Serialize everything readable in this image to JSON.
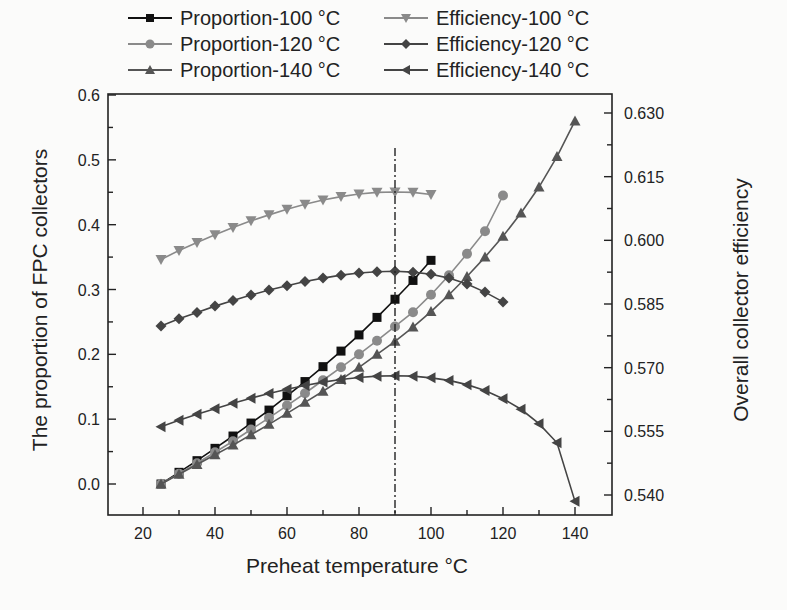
{
  "chart_data": {
    "type": "line",
    "title": "",
    "xlabel": "Preheat temperature °C",
    "ylabel": "The proportion of FPC collectors",
    "y2label": "Overall collector efficiency",
    "xlim": [
      10,
      150
    ],
    "ylim": [
      -0.05,
      0.6
    ],
    "y2lim": [
      0.5355,
      0.633
    ],
    "xticks": [
      20,
      40,
      60,
      80,
      100,
      120,
      140
    ],
    "yticks": [
      "0.0",
      "0.1",
      "0.2",
      "0.3",
      "0.4",
      "0.5",
      "0.6"
    ],
    "y2ticks": [
      "0.540",
      "0.555",
      "0.570",
      "0.585",
      "0.600",
      "0.615",
      "0.630"
    ],
    "grid": false,
    "legend_position": "top",
    "annotations": [
      {
        "type": "vertical-dash-dot-line",
        "x": 90
      }
    ],
    "series": [
      {
        "name": "Proportion-100 °C",
        "axis": "left",
        "marker": "square",
        "color": "#111111",
        "x": [
          25,
          30,
          35,
          40,
          45,
          50,
          55,
          60,
          65,
          70,
          75,
          80,
          85,
          90,
          95,
          100
        ],
        "values": [
          0.0,
          0.018,
          0.036,
          0.055,
          0.074,
          0.094,
          0.114,
          0.136,
          0.158,
          0.181,
          0.205,
          0.23,
          0.257,
          0.285,
          0.314,
          0.345
        ]
      },
      {
        "name": "Proportion-120 °C",
        "axis": "left",
        "marker": "circle",
        "color": "#8a8a8a",
        "x": [
          25,
          30,
          35,
          40,
          45,
          50,
          55,
          60,
          65,
          70,
          75,
          80,
          85,
          90,
          95,
          100,
          105,
          110,
          115,
          120
        ],
        "values": [
          0.0,
          0.016,
          0.032,
          0.049,
          0.066,
          0.084,
          0.102,
          0.121,
          0.14,
          0.16,
          0.18,
          0.2,
          0.221,
          0.243,
          0.265,
          0.292,
          0.322,
          0.355,
          0.39,
          0.445
        ]
      },
      {
        "name": "Proportion-140 °C",
        "axis": "left",
        "marker": "triangle-up",
        "color": "#555555",
        "x": [
          25,
          30,
          35,
          40,
          45,
          50,
          55,
          60,
          65,
          70,
          75,
          80,
          85,
          90,
          95,
          100,
          105,
          110,
          115,
          120,
          125,
          130,
          135,
          140
        ],
        "values": [
          0.0,
          0.015,
          0.03,
          0.045,
          0.06,
          0.076,
          0.092,
          0.109,
          0.126,
          0.143,
          0.161,
          0.18,
          0.2,
          0.22,
          0.242,
          0.266,
          0.292,
          0.32,
          0.35,
          0.382,
          0.418,
          0.458,
          0.505,
          0.56
        ]
      },
      {
        "name": "Efficiency-100 °C",
        "axis": "right",
        "marker": "triangle-down",
        "color": "#8a8a8a",
        "x": [
          25,
          30,
          35,
          40,
          45,
          50,
          55,
          60,
          65,
          70,
          75,
          80,
          85,
          90,
          95,
          100
        ],
        "values": [
          0.5955,
          0.5976,
          0.5995,
          0.6013,
          0.603,
          0.6046,
          0.606,
          0.6073,
          0.6085,
          0.6095,
          0.6103,
          0.6109,
          0.6113,
          0.6114,
          0.6113,
          0.6108
        ]
      },
      {
        "name": "Efficiency-120 °C",
        "axis": "right",
        "marker": "diamond",
        "color": "#444444",
        "x": [
          25,
          30,
          35,
          40,
          45,
          50,
          55,
          60,
          65,
          70,
          75,
          80,
          85,
          90,
          95,
          100,
          105,
          110,
          115,
          120
        ],
        "values": [
          0.5798,
          0.5815,
          0.583,
          0.5845,
          0.5858,
          0.5871,
          0.5883,
          0.5893,
          0.5903,
          0.5911,
          0.5918,
          0.5923,
          0.5926,
          0.5927,
          0.5925,
          0.592,
          0.5911,
          0.5897,
          0.5878,
          0.5855
        ]
      },
      {
        "name": "Efficiency-140 °C",
        "axis": "right",
        "marker": "triangle-left",
        "color": "#444444",
        "x": [
          25,
          30,
          35,
          40,
          45,
          50,
          55,
          60,
          65,
          70,
          75,
          80,
          85,
          90,
          95,
          100,
          105,
          110,
          115,
          120,
          125,
          130,
          135,
          140
        ],
        "values": [
          0.5561,
          0.5576,
          0.559,
          0.5603,
          0.5616,
          0.5628,
          0.5639,
          0.5649,
          0.5658,
          0.5666,
          0.5672,
          0.5677,
          0.568,
          0.5681,
          0.568,
          0.5676,
          0.567,
          0.566,
          0.5646,
          0.5627,
          0.5602,
          0.5568,
          0.5523,
          0.5385
        ]
      }
    ]
  }
}
